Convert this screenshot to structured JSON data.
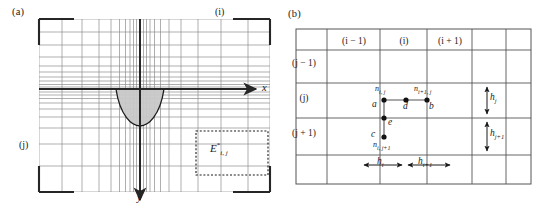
{
  "figure": {
    "panels": [
      {
        "id": "a",
        "label": "(a)",
        "axes": {
          "x_label": "x",
          "y_label": "y"
        },
        "index_tags": {
          "i": "(i)",
          "j": "(j)"
        },
        "element_label": {
          "base": "E",
          "superscript": "*",
          "subscript": "i, j"
        },
        "description": "non-uniform Cartesian mesh with downward y-axis and shaded parabolic region"
      },
      {
        "id": "b",
        "label": "(b)",
        "column_headers": [
          "(i − 1)",
          "(i)",
          "(i + 1)"
        ],
        "row_headers": [
          "(j − 1)",
          "(j)",
          "(j + 1)"
        ],
        "nodes": [
          {
            "key": "a",
            "point_label": "a",
            "node_label": {
              "base": "n",
              "subscript": "i, j"
            }
          },
          {
            "key": "b",
            "point_label": "b",
            "node_label": {
              "base": "n",
              "subscript": "i+1, j"
            }
          },
          {
            "key": "d",
            "point_label": "d",
            "node_label": null
          },
          {
            "key": "e",
            "point_label": "e",
            "node_label": null
          },
          {
            "key": "c",
            "point_label": "c",
            "node_label": {
              "base": "n",
              "subscript": "i, j+1"
            }
          }
        ],
        "spacings": [
          {
            "base": "h",
            "subscript": "i",
            "orientation": "horizontal"
          },
          {
            "base": "h",
            "subscript": "i+1",
            "orientation": "horizontal"
          },
          {
            "base": "h",
            "subscript": "j",
            "orientation": "vertical"
          },
          {
            "base": "h",
            "subscript": "j+1",
            "orientation": "vertical"
          }
        ]
      }
    ]
  },
  "colors": {
    "line": "#4d4d4d",
    "grid_light": "#8c8c8c",
    "heavy": "#262626",
    "shade_fill": "#c8c8c8",
    "background": "#ffffff"
  }
}
